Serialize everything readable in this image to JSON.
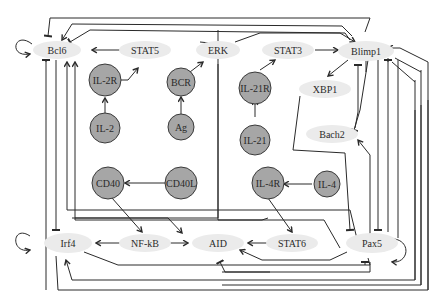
{
  "diagram": {
    "type": "gene regulatory network",
    "nodes": {
      "bcl6": {
        "label": "Bcl6",
        "shape": "oval"
      },
      "stat5": {
        "label": "STAT5",
        "shape": "oval"
      },
      "erk": {
        "label": "ERK",
        "shape": "oval"
      },
      "stat3": {
        "label": "STAT3",
        "shape": "oval"
      },
      "blimp1": {
        "label": "Blimp1",
        "shape": "oval"
      },
      "xbp1": {
        "label": "XBP1",
        "shape": "oval"
      },
      "bach2": {
        "label": "Bach2",
        "shape": "oval"
      },
      "irf4": {
        "label": "Irf4",
        "shape": "oval"
      },
      "nfkb": {
        "label": "NF-kB",
        "shape": "oval"
      },
      "aid": {
        "label": "AID",
        "shape": "oval"
      },
      "stat6": {
        "label": "STAT6",
        "shape": "oval"
      },
      "pax5": {
        "label": "Pax5",
        "shape": "oval"
      },
      "il2r": {
        "label": "IL-2R",
        "shape": "circle"
      },
      "il2": {
        "label": "IL-2",
        "shape": "circle"
      },
      "bcr": {
        "label": "BCR",
        "shape": "circle"
      },
      "ag": {
        "label": "Ag",
        "shape": "circle"
      },
      "il21r": {
        "label": "IL-21R",
        "shape": "circle"
      },
      "il21": {
        "label": "IL-21",
        "shape": "circle"
      },
      "cd40": {
        "label": "CD40",
        "shape": "circle"
      },
      "cd40l": {
        "label": "CD40L",
        "shape": "circle"
      },
      "il4r": {
        "label": "IL-4R",
        "shape": "circle"
      },
      "il4": {
        "label": "IL-4",
        "shape": "circle"
      }
    },
    "edges": [
      {
        "from": "STAT5",
        "to": "Bcl6",
        "type": "activation"
      },
      {
        "from": "IL-2R",
        "to": "STAT5",
        "type": "activation"
      },
      {
        "from": "IL-2",
        "to": "IL-2R",
        "type": "activation"
      },
      {
        "from": "BCR",
        "to": "ERK",
        "type": "activation"
      },
      {
        "from": "Ag",
        "to": "BCR",
        "type": "activation"
      },
      {
        "from": "ERK",
        "to": "Blimp1",
        "type": "activation"
      },
      {
        "from": "ERK",
        "to": "Bcl6",
        "type": "inhibition"
      },
      {
        "from": "IL-21R",
        "to": "STAT3",
        "type": "activation"
      },
      {
        "from": "IL-21",
        "to": "IL-21R",
        "type": "activation"
      },
      {
        "from": "STAT3",
        "to": "Blimp1",
        "type": "activation"
      },
      {
        "from": "Blimp1",
        "to": "XBP1",
        "type": "activation"
      },
      {
        "from": "Blimp1",
        "to": "Bach2",
        "type": "inhibition"
      },
      {
        "from": "Bach2",
        "to": "Blimp1",
        "type": "inhibition"
      },
      {
        "from": "Blimp1",
        "to": "Bcl6",
        "type": "inhibition"
      },
      {
        "from": "Bcl6",
        "to": "Blimp1",
        "type": "inhibition"
      },
      {
        "from": "Bcl6",
        "to": "Bcl6",
        "type": "self-activation"
      },
      {
        "from": "Bcl6",
        "to": "Irf4",
        "type": "inhibition"
      },
      {
        "from": "CD40L",
        "to": "CD40",
        "type": "activation"
      },
      {
        "from": "CD40",
        "to": "NF-kB",
        "type": "activation"
      },
      {
        "from": "NF-kB",
        "to": "Irf4",
        "type": "activation"
      },
      {
        "from": "NF-kB",
        "to": "AID",
        "type": "activation"
      },
      {
        "from": "IL-4",
        "to": "IL-4R",
        "type": "activation"
      },
      {
        "from": "IL-4R",
        "to": "STAT6",
        "type": "activation"
      },
      {
        "from": "STAT6",
        "to": "AID",
        "type": "activation"
      },
      {
        "from": "STAT6",
        "to": "Bcl6",
        "type": "activation"
      },
      {
        "from": "Pax5",
        "to": "AID",
        "type": "activation"
      },
      {
        "from": "Pax5",
        "to": "Bach2",
        "type": "activation"
      },
      {
        "from": "Pax5",
        "to": "Pax5",
        "type": "self-activation"
      },
      {
        "from": "Pax5",
        "to": "Bcl6",
        "type": "activation"
      },
      {
        "from": "XBP1",
        "to": "Pax5",
        "type": "inhibition"
      },
      {
        "from": "Blimp1",
        "to": "Pax5",
        "type": "inhibition"
      },
      {
        "from": "Irf4",
        "to": "Blimp1",
        "type": "activation"
      },
      {
        "from": "Irf4",
        "to": "Irf4",
        "type": "self-activation"
      },
      {
        "from": "Irf4",
        "to": "AID",
        "type": "activation"
      },
      {
        "from": "Blimp1",
        "to": "Irf4",
        "type": "activation"
      },
      {
        "from": "Bach2",
        "to": "AID",
        "type": "inhibition"
      },
      {
        "from": "IL-21R",
        "to": "Bcl6",
        "type": "activation"
      },
      {
        "from": "Pax5",
        "to": "Blimp1",
        "type": "inhibition"
      }
    ]
  }
}
